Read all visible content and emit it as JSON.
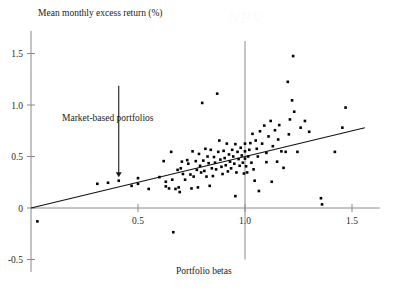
{
  "figure": {
    "watermark": "NPV",
    "ylabel": "Mean monthly excess return (%)",
    "xlabel": "Portfolio betas",
    "annotation": "Market-based portfolios"
  },
  "chart_data": {
    "type": "scatter",
    "title": "",
    "xlabel": "Portfolio betas",
    "ylabel": "Mean monthly excess return (%)",
    "xlim": [
      -0.06,
      1.63
    ],
    "ylim": [
      -0.62,
      1.72
    ],
    "xticks": [
      0.5,
      1.0,
      1.5
    ],
    "xtick_labels": [
      "0.5",
      "1.0",
      "1.5"
    ],
    "yticks": [
      -0.5,
      0,
      0.5,
      1.0,
      1.5
    ],
    "ytick_labels": [
      "-0.5",
      "0",
      "0.5",
      "1.0",
      "1.5"
    ],
    "grid": false,
    "legend": null,
    "annotations": [
      {
        "text": "Market-based portfolios",
        "x": 0.29,
        "y": 1.07,
        "arrow_to": {
          "x": 0.41,
          "y": 0.27
        }
      }
    ],
    "reference_lines": [
      {
        "name": "market-beta-line",
        "orientation": "vertical",
        "x": 1.0,
        "y_from": -0.5,
        "y_to": 1.62,
        "color": "#8a8a8a"
      },
      {
        "name": "zero-return-line",
        "orientation": "horizontal",
        "y": 0,
        "x_from": 0.0,
        "x_to": 1.63,
        "color": "#8a8a8a"
      }
    ],
    "fit_line": {
      "name": "security-market-line",
      "type": "linear",
      "intercept": 0.0,
      "slope": 0.5,
      "x_from": 0.0,
      "x_to": 1.56,
      "color": "#111111"
    },
    "marker": {
      "shape": "square",
      "size": 2.6,
      "color": "#000000"
    },
    "points": [
      {
        "x": 0.03,
        "y": -0.13
      },
      {
        "x": 0.31,
        "y": 0.235
      },
      {
        "x": 0.36,
        "y": 0.245
      },
      {
        "x": 0.41,
        "y": 0.265
      },
      {
        "x": 0.47,
        "y": 0.215
      },
      {
        "x": 0.5,
        "y": 0.29
      },
      {
        "x": 0.5,
        "y": 0.235
      },
      {
        "x": 0.55,
        "y": 0.185
      },
      {
        "x": 0.6,
        "y": 0.3
      },
      {
        "x": 0.62,
        "y": 0.455
      },
      {
        "x": 0.63,
        "y": 0.255
      },
      {
        "x": 0.63,
        "y": 0.21
      },
      {
        "x": 0.645,
        "y": 0.19
      },
      {
        "x": 0.655,
        "y": 0.545
      },
      {
        "x": 0.66,
        "y": 0.275
      },
      {
        "x": 0.665,
        "y": -0.235
      },
      {
        "x": 0.675,
        "y": 0.185
      },
      {
        "x": 0.685,
        "y": 0.37
      },
      {
        "x": 0.69,
        "y": 0.2
      },
      {
        "x": 0.695,
        "y": 0.155
      },
      {
        "x": 0.7,
        "y": 0.385
      },
      {
        "x": 0.705,
        "y": 0.45
      },
      {
        "x": 0.71,
        "y": 0.33
      },
      {
        "x": 0.72,
        "y": 0.275
      },
      {
        "x": 0.73,
        "y": 0.465
      },
      {
        "x": 0.735,
        "y": 0.43
      },
      {
        "x": 0.745,
        "y": 0.325
      },
      {
        "x": 0.75,
        "y": 0.19
      },
      {
        "x": 0.755,
        "y": 0.55
      },
      {
        "x": 0.76,
        "y": 0.305
      },
      {
        "x": 0.77,
        "y": 0.455
      },
      {
        "x": 0.775,
        "y": 0.37
      },
      {
        "x": 0.78,
        "y": 0.2
      },
      {
        "x": 0.785,
        "y": 0.525
      },
      {
        "x": 0.79,
        "y": 0.41
      },
      {
        "x": 0.795,
        "y": 0.345
      },
      {
        "x": 0.8,
        "y": 1.02
      },
      {
        "x": 0.805,
        "y": 0.46
      },
      {
        "x": 0.81,
        "y": 0.36
      },
      {
        "x": 0.815,
        "y": 0.575
      },
      {
        "x": 0.82,
        "y": 0.305
      },
      {
        "x": 0.825,
        "y": 0.5
      },
      {
        "x": 0.83,
        "y": 0.435
      },
      {
        "x": 0.835,
        "y": 0.215
      },
      {
        "x": 0.84,
        "y": 0.565
      },
      {
        "x": 0.845,
        "y": 0.385
      },
      {
        "x": 0.85,
        "y": 0.31
      },
      {
        "x": 0.855,
        "y": 0.495
      },
      {
        "x": 0.86,
        "y": 0.44
      },
      {
        "x": 0.865,
        "y": 0.375
      },
      {
        "x": 0.87,
        "y": 1.11
      },
      {
        "x": 0.875,
        "y": 0.545
      },
      {
        "x": 0.88,
        "y": 0.655
      },
      {
        "x": 0.885,
        "y": 0.47
      },
      {
        "x": 0.89,
        "y": 0.4
      },
      {
        "x": 0.895,
        "y": 0.33
      },
      {
        "x": 0.9,
        "y": 0.555
      },
      {
        "x": 0.905,
        "y": 0.485
      },
      {
        "x": 0.91,
        "y": 0.415
      },
      {
        "x": 0.915,
        "y": 0.625
      },
      {
        "x": 0.92,
        "y": 0.355
      },
      {
        "x": 0.925,
        "y": 0.52
      },
      {
        "x": 0.93,
        "y": 0.45
      },
      {
        "x": 0.935,
        "y": 0.385
      },
      {
        "x": 0.94,
        "y": 0.565
      },
      {
        "x": 0.945,
        "y": 0.5
      },
      {
        "x": 0.95,
        "y": 0.43
      },
      {
        "x": 0.955,
        "y": 0.62
      },
      {
        "x": 0.955,
        "y": 0.115
      },
      {
        "x": 0.96,
        "y": 0.345
      },
      {
        "x": 0.965,
        "y": 0.545
      },
      {
        "x": 0.97,
        "y": 0.475
      },
      {
        "x": 0.975,
        "y": 0.41
      },
      {
        "x": 0.98,
        "y": 0.585
      },
      {
        "x": 0.985,
        "y": 0.51
      },
      {
        "x": 0.99,
        "y": 0.44
      },
      {
        "x": 0.995,
        "y": 0.335
      },
      {
        "x": 1.0,
        "y": 0.625
      },
      {
        "x": 1.0,
        "y": 0.55
      },
      {
        "x": 1.0,
        "y": 0.48
      },
      {
        "x": 1.005,
        "y": 0.405
      },
      {
        "x": 1.01,
        "y": 0.345
      },
      {
        "x": 1.015,
        "y": 0.5
      },
      {
        "x": 1.02,
        "y": 0.565
      },
      {
        "x": 1.025,
        "y": 0.63
      },
      {
        "x": 1.03,
        "y": 0.44
      },
      {
        "x": 1.035,
        "y": 0.72
      },
      {
        "x": 1.04,
        "y": 0.375
      },
      {
        "x": 1.045,
        "y": 0.265
      },
      {
        "x": 1.05,
        "y": 0.655
      },
      {
        "x": 1.055,
        "y": 0.575
      },
      {
        "x": 1.06,
        "y": 0.5
      },
      {
        "x": 1.065,
        "y": 0.165
      },
      {
        "x": 1.07,
        "y": 0.745
      },
      {
        "x": 1.08,
        "y": 0.625
      },
      {
        "x": 1.09,
        "y": 0.8
      },
      {
        "x": 1.1,
        "y": 0.535
      },
      {
        "x": 1.1,
        "y": 0.445
      },
      {
        "x": 1.11,
        "y": 0.695
      },
      {
        "x": 1.12,
        "y": 0.845
      },
      {
        "x": 1.125,
        "y": 0.255
      },
      {
        "x": 1.13,
        "y": 0.6
      },
      {
        "x": 1.14,
        "y": 0.755
      },
      {
        "x": 1.15,
        "y": 0.45
      },
      {
        "x": 1.155,
        "y": 0.665
      },
      {
        "x": 1.16,
        "y": 0.805
      },
      {
        "x": 1.17,
        "y": 0.55
      },
      {
        "x": 1.18,
        "y": 0.39
      },
      {
        "x": 1.19,
        "y": 0.545
      },
      {
        "x": 1.2,
        "y": 1.225
      },
      {
        "x": 1.205,
        "y": 0.715
      },
      {
        "x": 1.21,
        "y": 0.86
      },
      {
        "x": 1.22,
        "y": 1.045
      },
      {
        "x": 1.225,
        "y": 1.475
      },
      {
        "x": 1.23,
        "y": 0.935
      },
      {
        "x": 1.245,
        "y": 0.545
      },
      {
        "x": 1.26,
        "y": 0.78
      },
      {
        "x": 1.28,
        "y": 0.845
      },
      {
        "x": 1.3,
        "y": 0.74
      },
      {
        "x": 1.355,
        "y": 0.095
      },
      {
        "x": 1.36,
        "y": 0.035
      },
      {
        "x": 1.42,
        "y": 0.545
      },
      {
        "x": 1.455,
        "y": 0.78
      },
      {
        "x": 1.47,
        "y": 0.975
      }
    ]
  }
}
